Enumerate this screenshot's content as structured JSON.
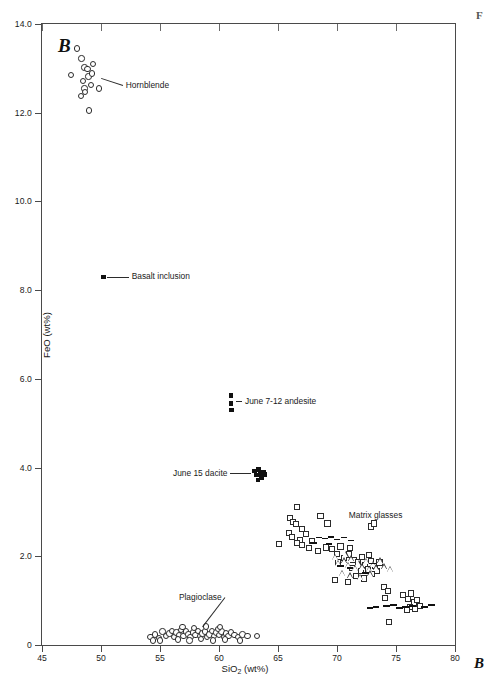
{
  "figure": {
    "panel_letter": "B",
    "corner_label_bottom_right": "B",
    "corner_label_top_right": "F"
  },
  "chart_data": {
    "type": "scatter",
    "title": "",
    "xlabel": "SiO2 (wt%)",
    "ylabel": "FeO (wt%)",
    "xlim": [
      45,
      80
    ],
    "ylim": [
      0,
      14
    ],
    "xticks": [
      45,
      50,
      55,
      60,
      65,
      70,
      75,
      80
    ],
    "xticklabels": [
      "45",
      "50",
      "55",
      "60",
      "65",
      "70",
      "75",
      "80"
    ],
    "yticks": [
      0,
      2,
      4,
      6,
      8,
      10,
      12,
      14
    ],
    "yticklabels": [
      "0",
      "2.0",
      "4.0",
      "6.0",
      "8.0",
      "10.0",
      "12.0",
      "14.0"
    ],
    "grid": false,
    "legend": "none",
    "annotations": [
      {
        "text": "Hornblende",
        "x": 52.1,
        "y": 12.62,
        "leader_to": [
          50.0,
          12.78
        ]
      },
      {
        "text": "Basalt inclusion",
        "x": 52.6,
        "y": 8.3,
        "leader_to": [
          50.5,
          8.3
        ]
      },
      {
        "text": "June 7-12 andesite",
        "x": 62.2,
        "y": 5.5,
        "leader_to": [
          61.4,
          5.5
        ]
      },
      {
        "text": "June 15 dacite",
        "x": 56.1,
        "y": 3.87,
        "leader_to": [
          62.7,
          3.87
        ]
      },
      {
        "text": "Plagioclase",
        "x": 56.6,
        "y": 1.08,
        "leader_to": [
          58.6,
          0.42
        ]
      },
      {
        "text": "Matrix glasses",
        "x": 71.0,
        "y": 2.92,
        "leader_to": null
      }
    ],
    "series": [
      {
        "name": "Hornblende",
        "marker": "open-circle",
        "points": [
          [
            47.45,
            12.85
          ],
          [
            47.95,
            13.45
          ],
          [
            48.35,
            13.22
          ],
          [
            48.6,
            13.02
          ],
          [
            48.85,
            12.98
          ],
          [
            48.95,
            12.82
          ],
          [
            48.45,
            12.72
          ],
          [
            48.6,
            12.55
          ],
          [
            48.62,
            12.47
          ],
          [
            48.3,
            12.38
          ],
          [
            49.25,
            12.88
          ],
          [
            49.3,
            13.1
          ],
          [
            49.15,
            12.62
          ],
          [
            49.85,
            12.55
          ],
          [
            49.0,
            12.05
          ]
        ]
      },
      {
        "name": "Basalt inclusion",
        "marker": "filled-square",
        "points": [
          [
            50.2,
            8.3
          ]
        ]
      },
      {
        "name": "June 7-12 andesite",
        "marker": "filled-square",
        "points": [
          [
            61.0,
            5.62
          ],
          [
            61.0,
            5.45
          ],
          [
            61.05,
            5.3
          ]
        ]
      },
      {
        "name": "June 15 dacite",
        "marker": "filled-square",
        "points": [
          [
            63.0,
            3.92
          ],
          [
            63.2,
            3.83
          ],
          [
            63.35,
            3.95
          ],
          [
            63.5,
            3.86
          ],
          [
            63.6,
            3.78
          ],
          [
            63.75,
            3.9
          ],
          [
            63.9,
            3.84
          ],
          [
            63.3,
            3.72
          ]
        ]
      },
      {
        "name": "Matrix glasses (squares)",
        "marker": "open-square",
        "points": [
          [
            66.6,
            3.12
          ],
          [
            66.0,
            2.86
          ],
          [
            66.3,
            2.78
          ],
          [
            66.55,
            2.72
          ],
          [
            65.9,
            2.52
          ],
          [
            67.0,
            2.62
          ],
          [
            66.2,
            2.44
          ],
          [
            66.85,
            2.36
          ],
          [
            66.6,
            2.3
          ],
          [
            67.05,
            2.26
          ],
          [
            67.35,
            2.5
          ],
          [
            67.9,
            2.34
          ],
          [
            65.1,
            2.28
          ],
          [
            67.6,
            2.18
          ],
          [
            68.4,
            2.12
          ],
          [
            69.1,
            2.2
          ],
          [
            69.6,
            2.16
          ],
          [
            70.0,
            2.06
          ],
          [
            70.3,
            2.22
          ],
          [
            70.1,
            1.88
          ],
          [
            70.6,
            1.96
          ],
          [
            71.0,
            2.04
          ],
          [
            71.4,
            1.92
          ],
          [
            71.3,
            1.74
          ],
          [
            71.8,
            1.86
          ],
          [
            72.1,
            1.98
          ],
          [
            72.4,
            1.8
          ],
          [
            72.0,
            1.66
          ],
          [
            72.6,
            1.72
          ],
          [
            72.9,
            1.9
          ],
          [
            73.2,
            1.78
          ],
          [
            73.0,
            1.6
          ],
          [
            73.4,
            1.66
          ],
          [
            71.6,
            1.56
          ],
          [
            72.3,
            1.5
          ],
          [
            69.8,
            1.46
          ],
          [
            70.9,
            1.42
          ],
          [
            73.6,
            1.86
          ],
          [
            72.7,
            2.02
          ],
          [
            71.1,
            2.18
          ],
          [
            74.0,
            1.3
          ],
          [
            74.3,
            1.22
          ],
          [
            74.1,
            1.06
          ],
          [
            75.6,
            1.12
          ],
          [
            76.0,
            1.04
          ],
          [
            76.3,
            1.16
          ],
          [
            76.5,
            0.96
          ],
          [
            76.8,
            1.02
          ],
          [
            76.2,
            0.86
          ],
          [
            76.6,
            0.82
          ],
          [
            77.0,
            0.88
          ],
          [
            75.9,
            0.78
          ],
          [
            74.4,
            0.52
          ],
          [
            68.6,
            2.9
          ],
          [
            69.2,
            2.74
          ]
        ]
      },
      {
        "name": "Matrix glasses (triangles)",
        "marker": "open-triangle",
        "points": [
          [
            70.2,
            1.84
          ],
          [
            70.7,
            1.9
          ],
          [
            71.0,
            1.8
          ],
          [
            71.3,
            1.94
          ],
          [
            71.6,
            1.72
          ],
          [
            71.9,
            1.84
          ],
          [
            72.2,
            1.76
          ],
          [
            72.5,
            1.88
          ],
          [
            72.8,
            1.7
          ],
          [
            73.1,
            1.82
          ],
          [
            73.4,
            1.74
          ],
          [
            73.7,
            1.9
          ],
          [
            70.5,
            1.62
          ],
          [
            71.2,
            1.56
          ],
          [
            72.0,
            1.52
          ],
          [
            72.9,
            1.6
          ],
          [
            74.1,
            1.76
          ],
          [
            74.6,
            1.7
          ],
          [
            69.9,
            1.98
          ],
          [
            70.8,
            2.04
          ]
        ]
      },
      {
        "name": "Matrix glasses (dashes)",
        "marker": "dash",
        "points": [
          [
            68.5,
            2.42
          ],
          [
            69.0,
            2.4
          ],
          [
            69.5,
            2.44
          ],
          [
            70.0,
            2.38
          ],
          [
            70.6,
            2.42
          ],
          [
            71.2,
            2.36
          ],
          [
            68.0,
            2.3
          ],
          [
            69.3,
            2.28
          ],
          [
            70.3,
            1.78
          ],
          [
            71.1,
            1.74
          ],
          [
            72.4,
            1.62
          ],
          [
            73.0,
            1.84
          ],
          [
            73.3,
            0.86
          ],
          [
            74.2,
            0.88
          ],
          [
            74.8,
            0.9
          ],
          [
            75.3,
            0.84
          ],
          [
            75.8,
            0.86
          ],
          [
            76.4,
            0.88
          ],
          [
            77.4,
            0.86
          ],
          [
            78.0,
            0.9
          ],
          [
            72.8,
            0.84
          ]
        ]
      },
      {
        "name": "Plagioclase",
        "marker": "open-circle",
        "points": [
          [
            54.2,
            0.18
          ],
          [
            54.6,
            0.24
          ],
          [
            54.9,
            0.16
          ],
          [
            55.2,
            0.3
          ],
          [
            55.5,
            0.2
          ],
          [
            55.8,
            0.26
          ],
          [
            56.0,
            0.32
          ],
          [
            56.2,
            0.18
          ],
          [
            56.4,
            0.28
          ],
          [
            56.6,
            0.22
          ],
          [
            56.8,
            0.34
          ],
          [
            57.0,
            0.2
          ],
          [
            57.2,
            0.3
          ],
          [
            57.4,
            0.24
          ],
          [
            57.6,
            0.18
          ],
          [
            57.8,
            0.28
          ],
          [
            58.0,
            0.22
          ],
          [
            58.2,
            0.32
          ],
          [
            58.4,
            0.2
          ],
          [
            58.6,
            0.26
          ],
          [
            58.8,
            0.3
          ],
          [
            59.0,
            0.18
          ],
          [
            59.2,
            0.24
          ],
          [
            59.4,
            0.32
          ],
          [
            59.6,
            0.2
          ],
          [
            59.8,
            0.28
          ],
          [
            60.0,
            0.22
          ],
          [
            60.2,
            0.3
          ],
          [
            60.4,
            0.18
          ],
          [
            60.6,
            0.26
          ],
          [
            60.8,
            0.2
          ],
          [
            61.0,
            0.28
          ],
          [
            61.3,
            0.22
          ],
          [
            61.6,
            0.18
          ],
          [
            62.0,
            0.24
          ],
          [
            62.4,
            0.2
          ],
          [
            63.2,
            0.2
          ],
          [
            55.0,
            0.1
          ],
          [
            56.5,
            0.12
          ],
          [
            57.5,
            0.1
          ],
          [
            58.5,
            0.14
          ],
          [
            59.5,
            0.1
          ],
          [
            60.5,
            0.12
          ],
          [
            61.8,
            0.1
          ],
          [
            56.9,
            0.4
          ],
          [
            57.9,
            0.38
          ],
          [
            58.9,
            0.42
          ],
          [
            59.9,
            0.36
          ],
          [
            54.4,
            0.1
          ],
          [
            60.1,
            0.4
          ]
        ]
      }
    ]
  }
}
